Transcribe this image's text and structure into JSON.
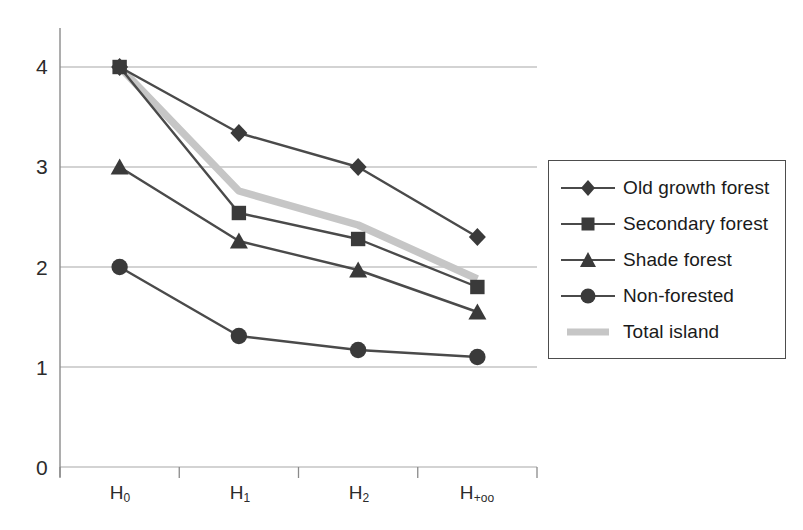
{
  "chart_data": {
    "type": "line",
    "title": "",
    "xlabel": "",
    "ylabel": "",
    "categories": [
      "H₀",
      "H₁",
      "H₊ₒₒ",
      "H₂"
    ],
    "x_tick_labels": [
      "H",
      "H",
      "H",
      "H"
    ],
    "x_tick_subscripts": [
      "0",
      "1",
      "2",
      "+oo"
    ],
    "y_tick_labels": [
      "0",
      "1",
      "2",
      "3",
      "4"
    ],
    "y_tick_values": [
      0,
      1,
      2,
      3,
      4
    ],
    "ylim": [
      0,
      4.35
    ],
    "grid": "horizontal",
    "legend_position": "right",
    "series": [
      {
        "name": "Old growth forest",
        "marker": "diamond",
        "color": "#4a4a4a",
        "values": [
          4.0,
          3.34,
          3.0,
          2.3
        ]
      },
      {
        "name": "Secondary forest",
        "marker": "square",
        "color": "#4a4a4a",
        "values": [
          4.0,
          2.54,
          2.28,
          1.8
        ]
      },
      {
        "name": "Shade forest",
        "marker": "triangle",
        "color": "#4a4a4a",
        "values": [
          3.0,
          2.26,
          1.97,
          1.55
        ]
      },
      {
        "name": "Non-forested",
        "marker": "circle",
        "color": "#4a4a4a",
        "values": [
          2.0,
          1.31,
          1.17,
          1.1
        ]
      },
      {
        "name": "Total island",
        "marker": "none",
        "color": "#c6c6c6",
        "values": [
          4.0,
          2.76,
          2.42,
          1.88
        ]
      }
    ]
  },
  "legend": {
    "items": [
      {
        "label": "Old growth forest"
      },
      {
        "label": "Secondary forest"
      },
      {
        "label": "Shade forest"
      },
      {
        "label": "Non-forested"
      },
      {
        "label": "Total island"
      }
    ]
  },
  "axes": {
    "y_labels": [
      "4",
      "3",
      "2",
      "1",
      "0"
    ],
    "x_labels": [
      {
        "base": "H",
        "sub": "0"
      },
      {
        "base": "H",
        "sub": "1"
      },
      {
        "base": "H",
        "sub": "2"
      },
      {
        "base": "H",
        "sub": "+oo"
      }
    ]
  },
  "colors": {
    "line_dark": "#4a4a4a",
    "line_light": "#c6c6c6",
    "grid": "#a8a8a8",
    "axis": "#8a8a8a",
    "text": "#1a1a1a"
  }
}
